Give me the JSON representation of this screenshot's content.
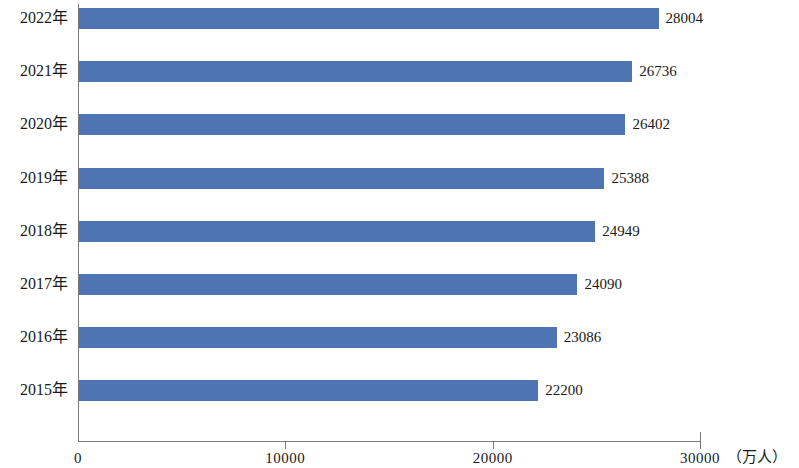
{
  "chart_data": {
    "type": "bar",
    "orientation": "horizontal",
    "title": "",
    "xlabel": "（万人）",
    "ylabel": "",
    "xlim": [
      0,
      30000
    ],
    "grid": false,
    "legend": null,
    "bar_color": "#4f74b2",
    "axis_color": "#7b7b7b",
    "xticks": [
      0,
      10000,
      20000,
      30000
    ],
    "xtick_labels": [
      "0",
      "10000",
      "20000",
      "30000"
    ],
    "categories": [
      "2022年",
      "2021年",
      "2020年",
      "2019年",
      "2018年",
      "2017年",
      "2016年",
      "2015年"
    ],
    "values": [
      28004,
      26736,
      26402,
      25388,
      24949,
      24090,
      23086,
      22200
    ],
    "data_labels": [
      "28004",
      "26736",
      "26402",
      "25388",
      "24949",
      "24090",
      "23086",
      "22200"
    ],
    "points": [
      {
        "category": "2022年",
        "value": 28004,
        "label": "28004"
      },
      {
        "category": "2021年",
        "value": 26736,
        "label": "26736"
      },
      {
        "category": "2020年",
        "value": 26402,
        "label": "26402"
      },
      {
        "category": "2019年",
        "value": 25388,
        "label": "25388"
      },
      {
        "category": "2018年",
        "value": 24949,
        "label": "24949"
      },
      {
        "category": "2017年",
        "value": 24090,
        "label": "24090"
      },
      {
        "category": "2016年",
        "value": 23086,
        "label": "23086"
      },
      {
        "category": "2015年",
        "value": 22200,
        "label": "22200"
      }
    ]
  }
}
